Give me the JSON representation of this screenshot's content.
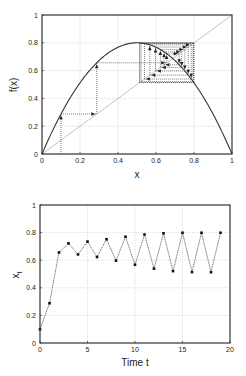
{
  "chart_data": [
    {
      "type": "line",
      "subtype": "cobweb",
      "title": "",
      "xlabel": "x",
      "ylabel": "f(x)",
      "xlim": [
        0,
        1
      ],
      "ylim": [
        0,
        1
      ],
      "xticks": [
        "0",
        "0.2",
        "0.4",
        "0.6",
        "0.8",
        "1"
      ],
      "yticks": [
        "0",
        "0.2",
        "0.4",
        "0.6",
        "0.8",
        "1"
      ],
      "grid": true,
      "legend": null,
      "series": [
        {
          "name": "f(x) = 3.2 x (1 - x)",
          "style": "solid",
          "color": "#333333",
          "r": 3.2
        },
        {
          "name": "y = x",
          "style": "solid",
          "color": "#bbbbbb"
        },
        {
          "name": "cobweb iterations",
          "style": "dotted-with-arrows",
          "color": "#333333",
          "x0": 0.1,
          "iterations": 19
        }
      ]
    },
    {
      "type": "line",
      "title": "",
      "xlabel": "Time t",
      "ylabel": "x_t",
      "ylabel_main": "x",
      "ylabel_sub": "t",
      "xlim": [
        0,
        20
      ],
      "ylim": [
        0,
        1
      ],
      "xticks": [
        "0",
        "5",
        "10",
        "15",
        "20"
      ],
      "yticks": [
        "0",
        "0.2",
        "0.4",
        "0.6",
        "0.8",
        "1"
      ],
      "grid": true,
      "legend": null,
      "x": [
        0,
        1,
        2,
        3,
        4,
        5,
        6,
        7,
        8,
        9,
        10,
        11,
        12,
        13,
        14,
        15,
        16,
        17,
        18,
        19
      ],
      "series": [
        {
          "name": "x_t",
          "style": "dotted-line-markers",
          "color": "#333333",
          "values": [
            0.1,
            0.288,
            0.656,
            0.722,
            0.642,
            0.735,
            0.623,
            0.752,
            0.597,
            0.77,
            0.567,
            0.786,
            0.539,
            0.795,
            0.521,
            0.799,
            0.514,
            0.799,
            0.513,
            0.799
          ]
        }
      ]
    }
  ]
}
